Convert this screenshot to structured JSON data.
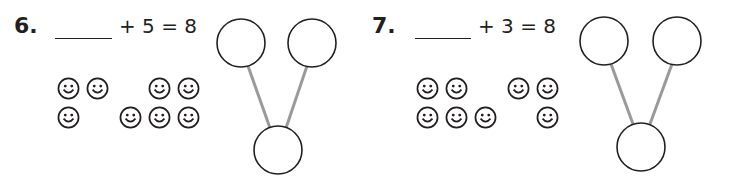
{
  "problems": [
    {
      "number": "6.",
      "blank": "",
      "equation_rest": "+ 5 = 8",
      "addend_known": 5,
      "total": 8,
      "left_group_count": 3,
      "right_group_count": 5,
      "number_bond": {
        "part_left": "",
        "part_right": "",
        "whole": ""
      }
    },
    {
      "number": "7.",
      "blank": "",
      "equation_rest": "+ 3 = 8",
      "addend_known": 3,
      "total": 8,
      "left_group_count": 5,
      "right_group_count": 3,
      "number_bond": {
        "part_left": "",
        "part_right": "",
        "whole": ""
      }
    }
  ],
  "icons": {
    "smiley": "smiley-face-icon"
  },
  "colors": {
    "ink": "#231f20",
    "bond_line": "#9a9a9a"
  }
}
